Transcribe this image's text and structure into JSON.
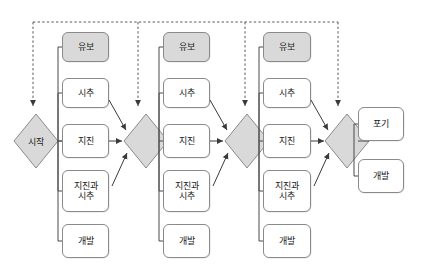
{
  "diagram": {
    "type": "decision-tree-flowchart",
    "background_color": "#ffffff",
    "box_fill_default": "#ffffff",
    "box_fill_shaded": "#d9d9d9",
    "diamond_fill": "#d9d9d9",
    "line_color": "#555555",
    "start": {
      "label": "시작"
    },
    "stages": [
      {
        "index": 1,
        "options": [
          {
            "label": "유보",
            "shaded": true
          },
          {
            "label": "시추",
            "shaded": false
          },
          {
            "label": "지진",
            "shaded": false
          },
          {
            "label": "지진과\n시추",
            "shaded": false
          },
          {
            "label": "개발",
            "shaded": false
          }
        ],
        "decision": {
          "label": ""
        }
      },
      {
        "index": 2,
        "options": [
          {
            "label": "유보",
            "shaded": true
          },
          {
            "label": "시추",
            "shaded": false
          },
          {
            "label": "지진",
            "shaded": false
          },
          {
            "label": "지진과\n시추",
            "shaded": false
          },
          {
            "label": "개발",
            "shaded": false
          }
        ],
        "decision": {
          "label": ""
        }
      },
      {
        "index": 3,
        "options": [
          {
            "label": "유보",
            "shaded": true
          },
          {
            "label": "시추",
            "shaded": false
          },
          {
            "label": "지진",
            "shaded": false
          },
          {
            "label": "지진과\n시추",
            "shaded": false
          },
          {
            "label": "개발",
            "shaded": false
          }
        ],
        "decision": {
          "label": ""
        }
      }
    ],
    "outcomes": [
      {
        "label": "포기",
        "shaded": false
      },
      {
        "label": "개발",
        "shaded": false
      }
    ]
  }
}
